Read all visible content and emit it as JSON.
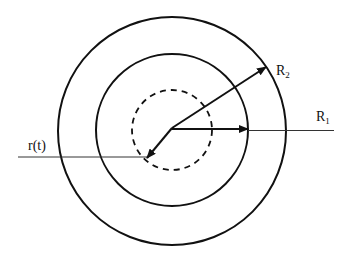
{
  "diagram": {
    "type": "concentric-circles",
    "center": {
      "x": 172,
      "y": 130
    },
    "circles": [
      {
        "name": "outer",
        "r": 114,
        "style": "solid"
      },
      {
        "name": "inner",
        "r": 77,
        "style": "solid"
      },
      {
        "name": "moving",
        "r": 40,
        "style": "dashed"
      }
    ],
    "labels": {
      "r_t": "r(t)",
      "R1_main": "R",
      "R1_sub": "1",
      "R2_main": "R",
      "R2_sub": "2"
    },
    "arrows": [
      {
        "name": "R1-arrow",
        "to": {
          "x": 248,
          "y": 130
        }
      },
      {
        "name": "R2-arrow",
        "to": {
          "x": 266,
          "y": 67
        }
      },
      {
        "name": "r-t-arrow",
        "to": {
          "x": 147,
          "y": 158
        }
      }
    ],
    "lines": [
      {
        "name": "R1-leader-line",
        "from": {
          "x": 248,
          "y": 131
        },
        "to": {
          "x": 334,
          "y": 131
        }
      },
      {
        "name": "r-t-leader-line",
        "from": {
          "x": 18,
          "y": 157
        },
        "to": {
          "x": 147,
          "y": 157
        }
      }
    ],
    "colors": {
      "stroke": "#111111",
      "background": "#ffffff"
    }
  }
}
